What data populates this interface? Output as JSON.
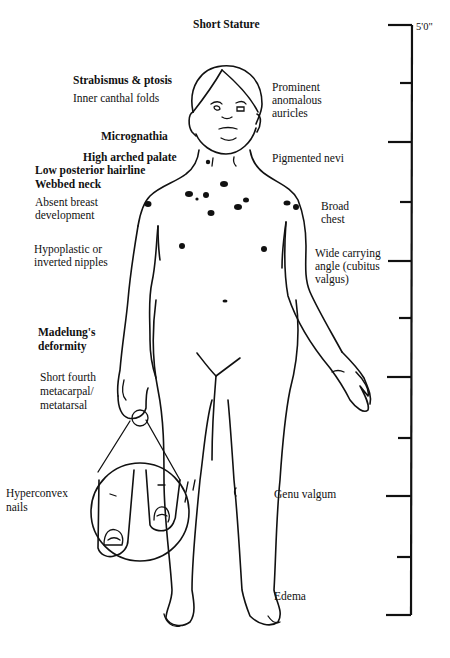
{
  "title": "Short Stature",
  "ruler": {
    "top_label": "5'0\"",
    "ticks": [
      {
        "y": 25,
        "type": "long"
      },
      {
        "y": 83,
        "type": "short"
      },
      {
        "y": 142,
        "type": "long"
      },
      {
        "y": 202,
        "type": "short"
      },
      {
        "y": 261,
        "type": "long"
      },
      {
        "y": 318,
        "type": "short"
      },
      {
        "y": 377,
        "type": "long"
      },
      {
        "y": 438,
        "type": "short"
      },
      {
        "y": 496,
        "type": "long"
      },
      {
        "y": 557,
        "type": "short"
      },
      {
        "y": 615,
        "type": "long"
      }
    ]
  },
  "labels_left": {
    "strabismus": "Strabismus & ptosis",
    "canthal": "Inner canthal folds",
    "micrognathia": "Micrognathia",
    "palate": "High arched palate",
    "hairline": "Low posterior hairline",
    "webbed_neck": "Webbed neck",
    "breast_1": "Absent breast",
    "breast_2": "development",
    "nipples_1": "Hypoplastic or",
    "nipples_2": "inverted nipples",
    "madelung_1": "Madelung's",
    "madelung_2": "deformity",
    "metacarpal_1": "Short fourth",
    "metacarpal_2": "metacarpal/",
    "metacarpal_3": "metatarsal",
    "nails_1": "Hyperconvex",
    "nails_2": "nails"
  },
  "labels_right": {
    "auricles_1": "Prominent",
    "auricles_2": "anomalous",
    "auricles_3": "auricles",
    "nevi": "Pigmented nevi",
    "chest_1": "Broad",
    "chest_2": "chest",
    "carrying_1": "Wide carrying",
    "carrying_2": "angle (cubitus",
    "carrying_3": "valgus)",
    "genu": "Genu valgum",
    "edema": "Edema"
  }
}
